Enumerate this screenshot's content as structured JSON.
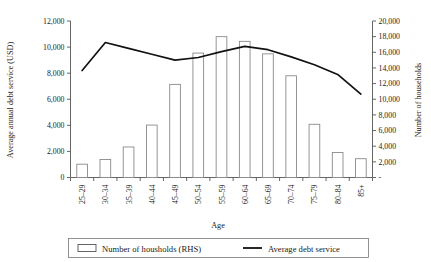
{
  "chart_data": {
    "type": "bar",
    "title": "",
    "xlabel": "Age",
    "categories": [
      "25–29",
      "30–34",
      "35–39",
      "40–44",
      "45–49",
      "50–54",
      "55–59",
      "60–64",
      "65–69",
      "70–74",
      "75–79",
      "80–84",
      "85+"
    ],
    "grid": false,
    "legend_position": "bottom",
    "axes": {
      "left": {
        "label": "Average annual debt service (USD)",
        "min": 0,
        "max": 12000,
        "step": 2000,
        "ticks": [
          "0",
          "2,000",
          "4,000",
          "6,000",
          "8,000",
          "10,000",
          "12,000"
        ]
      },
      "right": {
        "label": "Number of households",
        "min": 0,
        "max": 20000,
        "step": 2000,
        "ticks": [
          "-",
          "2,000",
          "4,000",
          "6,000",
          "8,000",
          "10,000",
          "12,000",
          "14,000",
          "16,000",
          "18,000",
          "20,000"
        ]
      }
    },
    "series": [
      {
        "name": "Number of housholds (RHS)",
        "type": "bar",
        "axis": "right",
        "values": [
          1700,
          2300,
          3900,
          6700,
          11900,
          15900,
          18000,
          17400,
          15800,
          13000,
          6800,
          3200,
          2400
        ]
      },
      {
        "name": "Average debt service",
        "type": "line",
        "axis": "left",
        "values": [
          8200,
          10350,
          9900,
          9450,
          9000,
          9200,
          9650,
          10050,
          9800,
          9250,
          8650,
          7900,
          6400
        ]
      }
    ]
  },
  "legend": {
    "bars_label": "Number of housholds (RHS)",
    "line_label": "Average debt service"
  },
  "colors": {
    "bar_stroke": "#8a8a8a",
    "bar_fill": "#ffffff",
    "line": "#111111",
    "axis": "#555555",
    "text": "#1a1a1a",
    "background": "#ffffff"
  }
}
